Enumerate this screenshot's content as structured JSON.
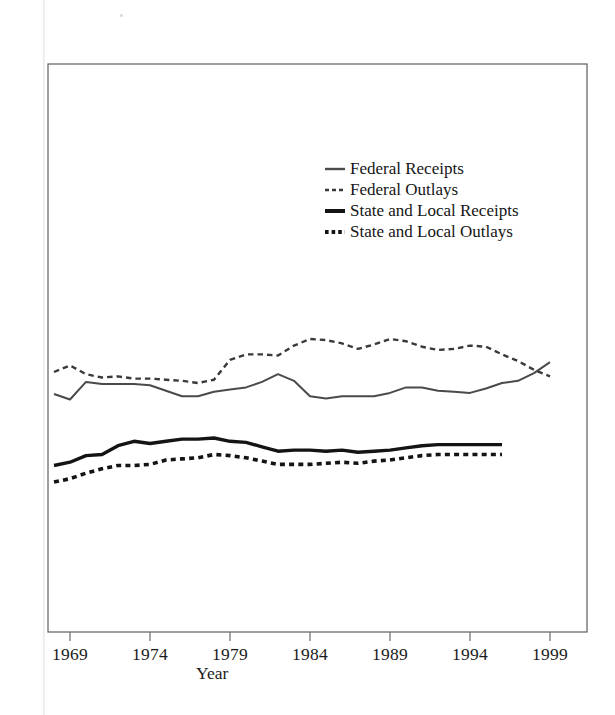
{
  "figure": {
    "xlabel": "Year",
    "ylabel": ""
  },
  "legend": {
    "position": "upper-center-right",
    "items": [
      {
        "label": "Federal Receipts",
        "swatch": "thin-solid-line-swatch"
      },
      {
        "label": "Federal Outlays",
        "swatch": "thin-dashed-line-swatch"
      },
      {
        "label": "State and Local Receipts",
        "swatch": "thick-solid-line-swatch"
      },
      {
        "label": "State and Local Outlays",
        "swatch": "thick-dashed-line-swatch"
      }
    ]
  },
  "axis": {
    "x_tick_labels": [
      "1969",
      "1974",
      "1979",
      "1984",
      "1989",
      "1994",
      "1999"
    ],
    "y_tick_labels": []
  },
  "chart_data": {
    "type": "line",
    "title": "",
    "subtitle": "",
    "xlabel": "Year",
    "ylabel": "",
    "xlim": [
      1968,
      2000.5
    ],
    "ylim": [
      0,
      40
    ],
    "grid": false,
    "legend_position": "upper-center-right",
    "x_ticks": [
      1969,
      1974,
      1979,
      1984,
      1989,
      1994,
      1999
    ],
    "note": "Y axis is unlabeled in the scan; values are percent-of-GDP style readings estimated from the plotted curve heights.",
    "series": [
      {
        "name": "Federal Receipts",
        "style": "thin-solid",
        "x": [
          1968,
          1969,
          1970,
          1971,
          1972,
          1973,
          1974,
          1975,
          1976,
          1977,
          1978,
          1979,
          1980,
          1981,
          1982,
          1983,
          1984,
          1985,
          1986,
          1987,
          1988,
          1989,
          1990,
          1991,
          1992,
          1993,
          1994,
          1995,
          1996,
          1997,
          1998,
          1999
        ],
        "values": [
          18.0,
          17.5,
          19.1,
          18.9,
          18.9,
          18.9,
          18.8,
          18.3,
          17.8,
          17.8,
          18.2,
          18.4,
          18.6,
          19.1,
          19.8,
          19.2,
          17.8,
          17.6,
          17.8,
          17.8,
          17.8,
          18.1,
          18.6,
          18.6,
          18.3,
          18.2,
          18.1,
          18.5,
          19.0,
          19.2,
          19.9,
          20.9
        ]
      },
      {
        "name": "Federal Outlays",
        "style": "thin-dashed",
        "x": [
          1968,
          1969,
          1970,
          1971,
          1972,
          1973,
          1974,
          1975,
          1976,
          1977,
          1978,
          1979,
          1980,
          1981,
          1982,
          1983,
          1984,
          1985,
          1986,
          1987,
          1988,
          1989,
          1990,
          1991,
          1992,
          1993,
          1994,
          1995,
          1996,
          1997,
          1998,
          1999
        ],
        "values": [
          20.0,
          20.6,
          19.8,
          19.5,
          19.6,
          19.4,
          19.4,
          19.3,
          19.2,
          19.0,
          19.3,
          21.1,
          21.6,
          21.6,
          21.5,
          22.4,
          23.0,
          22.9,
          22.6,
          22.1,
          22.5,
          23.0,
          22.8,
          22.3,
          22.0,
          22.1,
          22.4,
          22.3,
          21.6,
          21.0,
          20.2,
          19.6
        ]
      },
      {
        "name": "State and Local Receipts",
        "style": "thick-solid",
        "x": [
          1968,
          1969,
          1970,
          1971,
          1972,
          1973,
          1974,
          1975,
          1976,
          1977,
          1978,
          1979,
          1980,
          1981,
          1982,
          1983,
          1984,
          1985,
          1986,
          1987,
          1988,
          1989,
          1990,
          1991,
          1992,
          1993,
          1994,
          1995,
          1996
        ],
        "values": [
          11.5,
          11.8,
          12.4,
          12.5,
          13.3,
          13.7,
          13.5,
          13.7,
          13.9,
          13.9,
          14.0,
          13.7,
          13.6,
          13.2,
          12.8,
          12.9,
          12.9,
          12.8,
          12.9,
          12.7,
          12.8,
          12.9,
          13.1,
          13.3,
          13.4,
          13.4,
          13.4,
          13.4,
          13.4
        ]
      },
      {
        "name": "State and Local Outlays",
        "style": "thick-dashed",
        "x": [
          1968,
          1969,
          1970,
          1971,
          1972,
          1973,
          1974,
          1975,
          1976,
          1977,
          1978,
          1979,
          1980,
          1981,
          1982,
          1983,
          1984,
          1985,
          1986,
          1987,
          1988,
          1989,
          1990,
          1991,
          1992,
          1993,
          1994,
          1995,
          1996
        ],
        "values": [
          10.0,
          10.3,
          10.8,
          11.2,
          11.5,
          11.5,
          11.6,
          12.0,
          12.1,
          12.2,
          12.5,
          12.4,
          12.2,
          11.9,
          11.6,
          11.6,
          11.6,
          11.7,
          11.8,
          11.7,
          11.9,
          12.0,
          12.2,
          12.4,
          12.5,
          12.5,
          12.5,
          12.5,
          12.5
        ]
      }
    ]
  },
  "geometry": {
    "plot_left": 48,
    "plot_right": 587,
    "plot_top": 64,
    "plot_bottom": 632,
    "x_year_1969_px": 70,
    "px_per_year": 16,
    "y_value_to_px": {
      "value_ref": 18.0,
      "px_ref": 394,
      "px_per_unit": 11.0
    }
  }
}
